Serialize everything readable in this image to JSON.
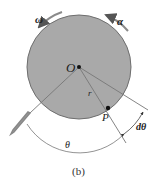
{
  "diagram": {
    "caption": "(b)",
    "labels": {
      "omega": "ω",
      "alpha": "α",
      "center": "O",
      "radius": "r",
      "point": "P",
      "theta": "θ",
      "dtheta": "dθ"
    },
    "colors": {
      "disk_fill": "#a9a9a9",
      "disk_stroke": "#6e6e6e",
      "lines": "#777777",
      "arrows": "#8a8a8a",
      "background": "#ffffff"
    }
  }
}
